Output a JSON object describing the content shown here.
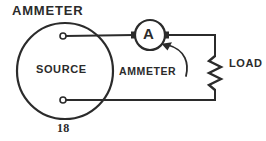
{
  "figure": {
    "title": "AMMETER",
    "figure_number": "18",
    "background_color": "#ffffff",
    "line_color": "#2b2b2b",
    "width": 266,
    "height": 141
  },
  "labels": {
    "title": "AMMETER",
    "source": "SOURCE",
    "meter_symbol_letter": "A",
    "ammeter_callout": "AMMETER",
    "load": "LOAD",
    "figure_number": "18"
  },
  "components": [
    {
      "name": "source",
      "type": "circle-source",
      "label": "SOURCE",
      "center": [
        65,
        71
      ],
      "radius": 48,
      "terminals": [
        {
          "name": "positive-terminal",
          "position": [
            62,
            36
          ]
        },
        {
          "name": "negative-terminal",
          "position": [
            62,
            100
          ]
        }
      ]
    },
    {
      "name": "ammeter",
      "type": "meter",
      "symbol_letter": "A",
      "callout": "AMMETER",
      "center": [
        150,
        35
      ],
      "radius": 15
    },
    {
      "name": "load",
      "type": "resistor",
      "label": "LOAD",
      "x": 215,
      "y_top": 55,
      "y_bottom": 90
    }
  ],
  "wires": [
    {
      "name": "source-to-ammeter",
      "from": [
        66,
        36
      ],
      "to": [
        133,
        35
      ]
    },
    {
      "name": "ammeter-to-load-top",
      "from": [
        167,
        35
      ],
      "to": [
        215,
        35
      ]
    },
    {
      "name": "load-right-down",
      "from": [
        215,
        35
      ],
      "to": [
        215,
        55
      ]
    },
    {
      "name": "load-bottom-down",
      "from": [
        215,
        90
      ],
      "to": [
        215,
        100
      ]
    },
    {
      "name": "load-to-source-return",
      "from": [
        215,
        100
      ],
      "to": [
        66,
        100
      ]
    }
  ],
  "callout_arrow": {
    "name": "ammeter-leader",
    "from": [
      186,
      72
    ],
    "to": [
      163,
      45
    ],
    "points_to": "ammeter"
  }
}
